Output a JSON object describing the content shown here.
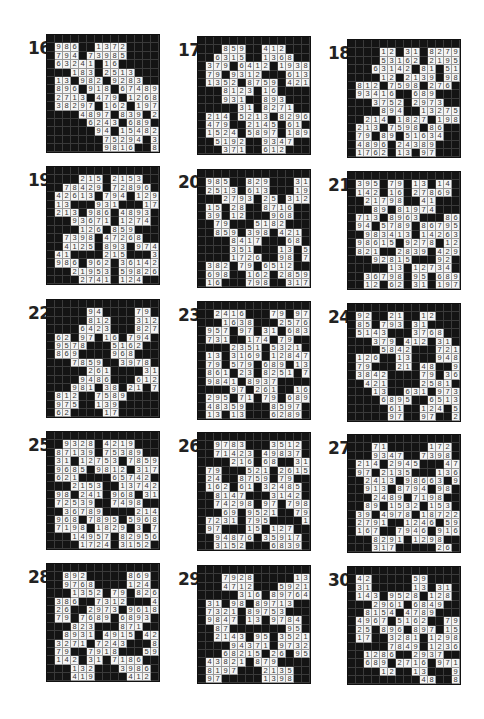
{
  "page": {
    "puzzles": [
      {
        "number": "16",
        "label_pos": [
          28,
          38
        ],
        "grid_pos": [
          46,
          34
        ],
        "rows": [
          "##############",
          "#986##1372####",
          "#794#73985####",
          "#63241#16#####",
          "###183#2513###",
          "#13#982#9283##",
          "#896#918#67489",
          "#2713#479#1268",
          "#38297#162#197",
          "####4897#839#25",
          "#####6243#689#",
          "######94#15482",
          "#######75294#361",
          "#######9816##894"
        ]
      },
      {
        "number": "17",
        "label_pos": [
          178,
          40
        ],
        "grid_pos": [
          197,
          36
        ],
        "rows": [
          "##############",
          "###859##412###",
          "##6315##1368##",
          "#379#6412#1938",
          "#79#9312###613",
          "#1352#8759#421",
          "###8123#16####",
          "###931##893###",
          "#####31#8271##",
          "#214#5213#8296",
          "#479##2145#61#",
          "#1524#5897#189",
          "##5192##9347##",
          "###371##612###"
        ]
      },
      {
        "number": "18",
        "label_pos": [
          328,
          43
        ],
        "grid_pos": [
          347,
          39
        ],
        "rows": [
          "##############",
          "####12#31#8279",
          "####53162#2195",
          "###63142#81#51",
          "####12#2139#986",
          "#812#7598#276#",
          "#93416##689###",
          "###3752#2973##",
          "####894##13275",
          "##214#1827#198",
          "#213#7598#86##",
          "#79#89#51634##",
          "#4896#24389###",
          "#1762#13#97###"
        ]
      },
      {
        "number": "19",
        "label_pos": [
          28,
          170
        ],
        "grid_pos": [
          46,
          166
        ],
        "rows": [
          "##############",
          "####215#2153##",
          "##78429#72896#",
          "#42613#794#129",
          "#13###931###17",
          "#213#986#4893#",
          "###93671#1274#",
          "####126#859###",
          "##7398#47268##",
          "##4125#893#974",
          "#41####215###31",
          "#986#962#36142",
          "###21953#59826",
          "####2741#124##"
        ]
      },
      {
        "number": "20",
        "label_pos": [
          178,
          172
        ],
        "grid_pos": [
          197,
          169
        ],
        "rows": [
          "##############",
          "#985##829###31",
          "#2513#613###194",
          "###2793#25#312",
          "#15#28##8716##",
          "#39#12###968##",
          "##79###5182###",
          "##859#398#421#",
          "####8417###68#",
          "####351###13#51",
          "####1726##98#73",
          "#382#79#6512##",
          "#698##162#2859",
          "#16###798##317"
        ]
      },
      {
        "number": "21",
        "label_pos": [
          328,
          175
        ],
        "grid_pos": [
          347,
          171
        ],
        "rows": [
          "##############",
          "#395#79#13#14#",
          "#142#16#27869#",
          "##21798##41###",
          "###89#81974###",
          "#713#8963###861",
          "#94#5789#86795",
          "##983413#14263#",
          "#98615#9278#12",
          "#821##2839#429",
          "###92815###92##",
          "#####13#12734#",
          "##36798#95#689",
          "##12#62#31#197"
        ]
      },
      {
        "number": "22",
        "label_pos": [
          28,
          303
        ],
        "grid_pos": [
          46,
          299
        ],
        "rows": [
          "##############",
          "#####94####79#",
          "#####812###312",
          "####6423###827",
          "#62#97#16#794#",
          "#9578###5162##",
          "#869####968###",
          "###7859##3978#",
          "#####261####316",
          "####9486###6128",
          "###981#38#21#79",
          "#812##7589####",
          "#975##139#####",
          "#62####17#####"
        ]
      },
      {
        "number": "23",
        "label_pos": [
          178,
          305
        ],
        "grid_pos": [
          197,
          301
        ],
        "rows": [
          "##############",
          "##2416###79#97",
          "###1638###25769",
          "#957#97#31#683",
          "#731##174#79###",
          "####2351#5321#",
          "#13#3169#12847",
          "#79#579#689#13",
          "#861#23#8251#79",
          "#9841#8937####",
          "####97#261##167",
          "#295#71#79#689",
          "#48359###8597#",
          "#13#13###6289#"
        ]
      },
      {
        "number": "24",
        "label_pos": [
          328,
          307
        ],
        "grid_pos": [
          347,
          303
        ],
        "rows": [
          "##############",
          "#92##21##12###",
          "#85#793#31####",
          "#5143###3768##",
          "###379#412#31#",
          "####5842###721",
          "#126##13###9486",
          "#79###21#48##97",
          "#3842####79#369",
          "##421####2581##",
          "###13##631#973#",
          "####6895##6513",
          "#####61##124#58",
          "#####97##97##21"
        ]
      },
      {
        "number": "25",
        "label_pos": [
          28,
          435
        ],
        "grid_pos": [
          46,
          431
        ],
        "rows": [
          "##############",
          "##9328#4219###",
          "#87139#75389##",
          "#31#12753#7859",
          "#9685#9812#317",
          "#621####65742#",
          "###2153##13742",
          "#98#241#968#31",
          "#72539##7498##",
          "##36789####214",
          "#968#7895#5968",
          "#7198#1829#3#79",
          "###14957#82956",
          "####1724#3152#"
        ]
      },
      {
        "number": "26",
        "label_pos": [
          178,
          436
        ],
        "grid_pos": [
          197,
          432
        ],
        "rows": [
          "##############",
          "##9783###3512#",
          "##71423#49837#",
          "####216#68##31",
          "#79###521#2615",
          "#24##8759#79###",
          "#162#61#32485#",
          "##8147###3142#",
          "##74298#97#798",
          "###69#9521##79",
          "#7231#795####14",
          "#97###15#127###",
          "##94876#35917#",
          "##3152###6839#"
        ]
      },
      {
        "number": "27",
        "label_pos": [
          328,
          438
        ],
        "grid_pos": [
          347,
          434
        ],
        "rows": [
          "##############",
          "###71#####172#",
          "###9347##7398#",
          "#214#2945###471",
          "#97#2135###1362",
          "##2413#98663#94",
          "##913#8794#98#",
          "###2489#7198##",
          "##89#1532#153#",
          "#39#4978#18722",
          "#2791##1246#59",
          "#167##7946#916",
          "###8291#1298###",
          "###317#####26#"
        ]
      },
      {
        "number": "28",
        "label_pos": [
          28,
          567
        ],
        "grid_pos": [
          46,
          563
        ],
        "rows": [
          "##############",
          "##892#####869#",
          "##9768####124#",
          "###1352#79#826",
          "#386##7312###49",
          "#26##2973#9618",
          "#79#7689#6893#",
          "###823###871##",
          "##8931#4915#42",
          "#3271#7243###84",
          "#79##7918###591",
          "#142#31#7186###",
          "###132###3986#",
          "###419####412#"
        ]
      },
      {
        "number": "29",
        "label_pos": [
          178,
          569
        ],
        "grid_pos": [
          197,
          565
        ],
        "rows": [
          "##############",
          "###7928#####13",
          "###4712###5921",
          "#####316#89764",
          "#31#98#89713##",
          "#7321#89753###",
          "#9847#13#9784#",
          "##87#######95#",
          "##2143#95#3521",
          "####94371#9732",
          "###68215#26#95",
          "#43821#879####",
          "#8197###2135##",
          "#97#####1398##"
        ]
      },
      {
        "number": "30",
        "label_pos": [
          328,
          570
        ],
        "grid_pos": [
          347,
          566
        ],
        "rows": [
          "##############",
          "#42#####59####",
          "#31#####13#31#",
          "#143#9528#128#",
          "###2961#6849##",
          "##8154#4789###",
          "#4967#5162##79",
          "#25#896#897#15",
          "#17##3281#1298",
          "#####7849#1236#",
          "##1286##2937##",
          "##689#2716#971",
          "####12##13###93",
          "#########48##82"
        ]
      }
    ]
  }
}
